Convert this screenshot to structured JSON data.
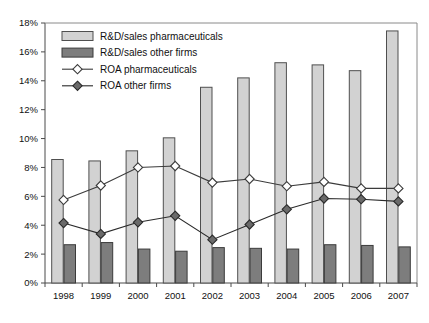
{
  "chart_data": {
    "type": "bar",
    "title": "",
    "subtitle": "",
    "xlabel": "",
    "ylabel": "",
    "categories": [
      "1998",
      "1999",
      "2000",
      "2001",
      "2002",
      "2003",
      "2004",
      "2005",
      "2006",
      "2007"
    ],
    "ylim": [
      0,
      18
    ],
    "ytick_values": [
      0,
      2,
      4,
      6,
      8,
      10,
      12,
      14,
      16,
      18
    ],
    "ytick_labels": [
      "0%",
      "2%",
      "4%",
      "6%",
      "8%",
      "10%",
      "12%",
      "14%",
      "16%",
      "18%"
    ],
    "grid": false,
    "legend_position": "top-left",
    "value_format": "percent",
    "series": [
      {
        "name": "R&D/sales pharmaceuticals",
        "type": "bar",
        "color": "#d2d2d2",
        "edge_color": "#4f4f4f",
        "marker": "none",
        "values": [
          8.55,
          8.45,
          9.15,
          10.05,
          13.55,
          14.2,
          15.25,
          15.1,
          14.7,
          17.45
        ]
      },
      {
        "name": "R&D/sales other firms",
        "type": "bar",
        "color": "#7d7d7d",
        "edge_color": "#3b3b3b",
        "marker": "none",
        "values": [
          2.65,
          2.8,
          2.35,
          2.2,
          2.45,
          2.4,
          2.35,
          2.65,
          2.6,
          2.5
        ]
      },
      {
        "name": "ROA pharmaceuticals",
        "type": "line",
        "color": "#6e6e6e",
        "edge_color": "#3b3b3b",
        "marker": "open-diamond",
        "values": [
          5.75,
          6.75,
          8.0,
          8.1,
          6.95,
          7.2,
          6.7,
          7.0,
          6.55,
          6.55
        ]
      },
      {
        "name": "ROA other firms",
        "type": "line",
        "color": "#4a4a4a",
        "edge_color": "#2a2a2a",
        "marker": "filled-diamond",
        "values": [
          4.15,
          3.4,
          4.2,
          4.65,
          3.0,
          4.05,
          5.1,
          5.85,
          5.8,
          5.65
        ]
      }
    ]
  },
  "legend": {
    "items": [
      {
        "label": "R&D/sales pharmaceuticals",
        "swatch": "light-bar-swatch"
      },
      {
        "label": "R&D/sales other firms",
        "swatch": "dark-bar-swatch"
      },
      {
        "label": "ROA pharmaceuticals",
        "swatch": "open-diamond-line-swatch"
      },
      {
        "label": "ROA other firms",
        "swatch": "filled-diamond-line-swatch"
      }
    ]
  }
}
